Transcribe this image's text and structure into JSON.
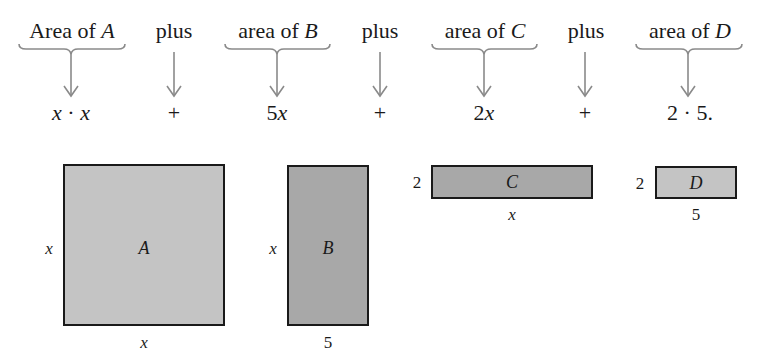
{
  "top_row": {
    "terms": [
      {
        "prefix": "Area of ",
        "var": "A",
        "expr": "x · x",
        "expr_parts": [
          {
            "t": "x",
            "i": true
          },
          {
            "t": " · ",
            "i": false
          },
          {
            "t": "x",
            "i": true
          }
        ],
        "has_brace": true
      },
      {
        "prefix": "plus",
        "var": "",
        "expr_parts": [
          {
            "t": "+",
            "i": false
          }
        ],
        "has_brace": false
      },
      {
        "prefix": "area of ",
        "var": "B",
        "expr_parts": [
          {
            "t": "5",
            "i": false
          },
          {
            "t": "x",
            "i": true
          }
        ],
        "has_brace": true
      },
      {
        "prefix": "plus",
        "var": "",
        "expr_parts": [
          {
            "t": "+",
            "i": false
          }
        ],
        "has_brace": false
      },
      {
        "prefix": "area of ",
        "var": "C",
        "expr_parts": [
          {
            "t": "2",
            "i": false
          },
          {
            "t": "x",
            "i": true
          }
        ],
        "has_brace": true
      },
      {
        "prefix": "plus",
        "var": "",
        "expr_parts": [
          {
            "t": "+",
            "i": false
          }
        ],
        "has_brace": false
      },
      {
        "prefix": "area of ",
        "var": "D",
        "expr_parts": [
          {
            "t": "2 · 5.",
            "i": false
          }
        ],
        "has_brace": true
      }
    ]
  },
  "rectangles": {
    "A": {
      "label": "A",
      "width_label": "x",
      "height_label": "x"
    },
    "B": {
      "label": "B",
      "width_label": "5",
      "height_label": "x"
    },
    "C": {
      "label": "C",
      "width_label": "x",
      "height_label": "2"
    },
    "D": {
      "label": "D",
      "width_label": "5",
      "height_label": "2"
    }
  },
  "colors": {
    "stroke": "#1a1a1a",
    "arrow": "#8a8a8a",
    "fill_light": "#c4c4c4",
    "fill_dark": "#a8a8a8"
  }
}
